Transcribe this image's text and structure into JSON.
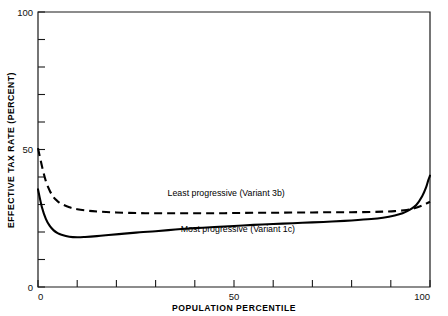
{
  "chart_data": {
    "type": "line",
    "title": "",
    "xlabel": "POPULATION PERCENTILE",
    "ylabel": "EFFECTIVE TAX RATE (PERCENT)",
    "xlim": [
      0,
      100
    ],
    "ylim": [
      0,
      100
    ],
    "grid": false,
    "legend_position": "inline-annotations",
    "x_tick_labels": [
      "0",
      "50",
      "100"
    ],
    "x_tick_values": [
      0,
      50,
      100
    ],
    "x_minor_ticks": [
      10,
      20,
      30,
      40,
      60,
      70,
      80,
      90
    ],
    "y_tick_labels": [
      "0",
      "50",
      "100"
    ],
    "y_tick_values": [
      0,
      50,
      100
    ],
    "y_minor_ticks": [
      10,
      20,
      30,
      40,
      60,
      70,
      80,
      90
    ],
    "series": [
      {
        "name": "Least progressive (Variant 3b)",
        "style": "dashed",
        "annotation": "Least progressive (Variant 3b)",
        "annotation_x": 48,
        "annotation_y": 33,
        "x": [
          0,
          1,
          2,
          3,
          4,
          5,
          6,
          8,
          10,
          13,
          16,
          20,
          25,
          30,
          35,
          40,
          45,
          50,
          55,
          60,
          65,
          70,
          75,
          80,
          85,
          88,
          91,
          94,
          96,
          98,
          99,
          100
        ],
        "values": [
          50.5,
          44.0,
          38.5,
          35.0,
          32.6,
          31.2,
          30.2,
          29.0,
          28.3,
          27.7,
          27.4,
          27.1,
          26.9,
          26.8,
          26.8,
          26.8,
          26.8,
          26.9,
          27.0,
          27.0,
          27.1,
          27.1,
          27.2,
          27.2,
          27.3,
          27.4,
          27.6,
          28.0,
          28.6,
          29.6,
          30.3,
          31.0
        ]
      },
      {
        "name": "Most progressive (Variant 1c)",
        "style": "solid",
        "annotation": "Most progressive (Variant 1c)",
        "annotation_x": 51,
        "annotation_y": 20,
        "x": [
          0,
          1,
          2,
          3,
          4,
          5,
          6,
          8,
          10,
          12,
          15,
          18,
          22,
          26,
          30,
          35,
          40,
          45,
          50,
          55,
          60,
          65,
          70,
          75,
          80,
          85,
          88,
          91,
          93,
          95,
          96.5,
          98,
          99,
          99.6,
          100
        ],
        "values": [
          35.5,
          29.0,
          24.8,
          22.2,
          20.6,
          19.6,
          19.0,
          18.3,
          18.1,
          18.2,
          18.5,
          18.9,
          19.4,
          19.9,
          20.3,
          20.9,
          21.4,
          21.8,
          22.2,
          22.6,
          22.9,
          23.2,
          23.5,
          23.8,
          24.2,
          24.7,
          25.2,
          26.0,
          26.8,
          28.2,
          29.8,
          33.0,
          36.2,
          39.0,
          40.5
        ]
      }
    ]
  }
}
